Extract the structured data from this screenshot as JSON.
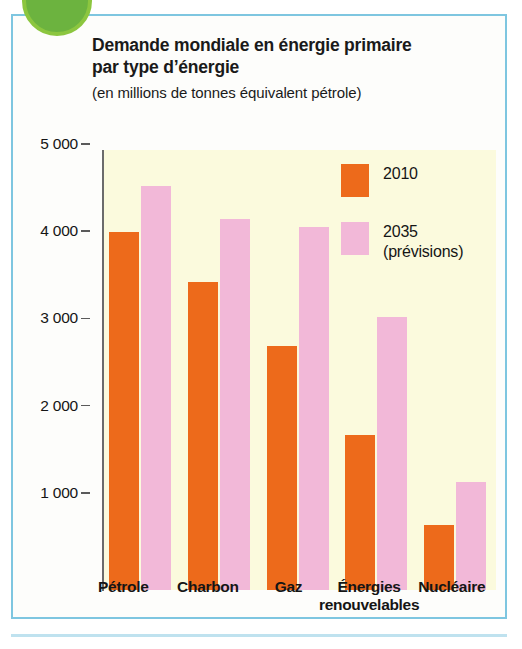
{
  "figure": {
    "title_lines": [
      "Demande mondiale en énergie primaire",
      "par type d’énergie"
    ],
    "subtitle": "(en millions de tonnes équivalent pétrole)",
    "panel_border_color": "#7ec6e0",
    "plot_background_color": "#fbfadd"
  },
  "legend": {
    "position": "inside-top-right",
    "entries": [
      {
        "label": "2010",
        "sub": "",
        "color": "#ed6a1b"
      },
      {
        "label": "2035",
        "sub": "(prévisions)",
        "color": "#f2b8d8"
      }
    ]
  },
  "chart_data": {
    "type": "bar",
    "title": "Demande mondiale en énergie primaire par type d’énergie",
    "subtitle": "(en millions de tonnes équivalent pétrole)",
    "xlabel": "",
    "ylabel": "",
    "unit": "millions de tonnes équivalent pétrole",
    "grid": false,
    "ylim": [
      0,
      5000
    ],
    "yticks": [
      1000,
      2000,
      3000,
      4000,
      5000
    ],
    "ytick_labels": [
      "1 000",
      "2 000",
      "3 000",
      "4 000",
      "5 000"
    ],
    "categories": [
      "Pétrole",
      "Charbon",
      "Gaz",
      "Énergies renouvelables",
      "Nucléaire"
    ],
    "category_label_lines": [
      [
        "Pétrole"
      ],
      [
        "Charbon"
      ],
      [
        "Gaz"
      ],
      [
        "Énergies",
        "renouvelables"
      ],
      [
        "Nucléaire"
      ]
    ],
    "series": [
      {
        "name": "2010",
        "color": "#ed6a1b",
        "values": [
          4170,
          3600,
          2870,
          1850,
          820
        ]
      },
      {
        "name": "2035 (prévisions)",
        "color": "#f2b8d8",
        "values": [
          4700,
          4320,
          4230,
          3200,
          1310
        ]
      }
    ]
  }
}
